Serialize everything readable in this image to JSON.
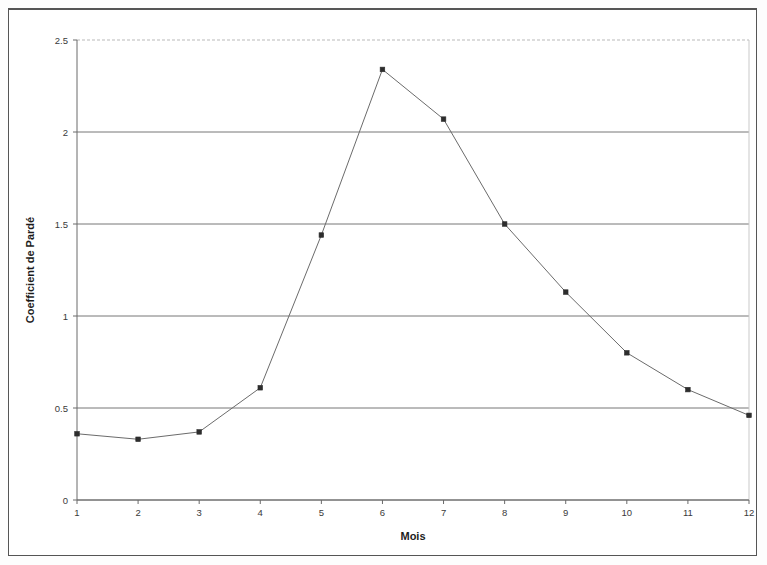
{
  "chart_data": {
    "type": "line",
    "title": "",
    "xlabel": "Mois",
    "ylabel": "Coefficient de Pardé",
    "x": [
      1,
      2,
      3,
      4,
      5,
      6,
      7,
      8,
      9,
      10,
      11,
      12
    ],
    "values": [
      0.36,
      0.33,
      0.37,
      0.61,
      1.44,
      2.34,
      2.07,
      1.5,
      1.13,
      0.8,
      0.6,
      0.46
    ],
    "series": [
      {
        "name": "Coefficient de Pardé",
        "values": [
          0.36,
          0.33,
          0.37,
          0.61,
          1.44,
          2.34,
          2.07,
          1.5,
          1.13,
          0.8,
          0.6,
          0.46
        ]
      }
    ],
    "xtick_labels": [
      "1",
      "2",
      "3",
      "4",
      "5",
      "6",
      "7",
      "8",
      "9",
      "10",
      "11",
      "12"
    ],
    "ytick_labels": [
      "0",
      "0.5",
      "1",
      "1.5",
      "2",
      "2.5"
    ],
    "ytick_values": [
      0,
      0.5,
      1,
      1.5,
      2,
      2.5
    ],
    "xlim": [
      1,
      12
    ],
    "ylim": [
      0,
      2.5
    ],
    "grid": "horizontal",
    "legend": "none",
    "line_color": "#6b6b6b",
    "marker_color": "#2d2d2d",
    "marker_shape": "square"
  },
  "page": {
    "background_color": "#ffffff",
    "border_color": "#555555"
  }
}
